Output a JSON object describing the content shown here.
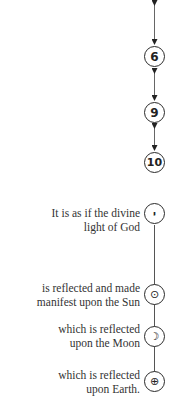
{
  "upper_chain": {
    "nodes": [
      {
        "label": "6"
      },
      {
        "label": "9"
      },
      {
        "label": "10"
      }
    ],
    "connector": "double-headed-arrow"
  },
  "lower_chain": {
    "items": [
      {
        "icon": "yod-icon",
        "glyph": "י",
        "caption_line1": "It is as if the divine",
        "caption_line2": "light of God"
      },
      {
        "icon": "sun-icon",
        "glyph": "⊙",
        "caption_line1": "is reflected and made",
        "caption_line2": "manifest upon the Sun"
      },
      {
        "icon": "moon-icon",
        "glyph": "☽",
        "caption_line1": "which is reflected",
        "caption_line2": "upon the Moon"
      },
      {
        "icon": "earth-icon",
        "glyph": "⊕",
        "caption_line1": "which is reflected",
        "caption_line2": "upon Earth."
      }
    ]
  }
}
